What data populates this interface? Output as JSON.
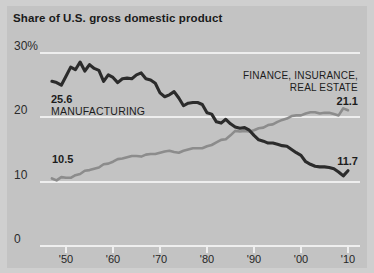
{
  "chart_data": {
    "type": "line",
    "title": "Share of U.S. gross domestic product",
    "xlabel": "",
    "ylabel": "",
    "ylim": [
      0,
      30
    ],
    "xlim": [
      1947,
      2011
    ],
    "grid": true,
    "legend_position": "inline-annotation",
    "yticks": [
      "30%",
      "20",
      "10",
      "0"
    ],
    "ytick_values": [
      30,
      20,
      10,
      0
    ],
    "xticks": [
      "'50",
      "'60",
      "'70",
      "'80",
      "'90",
      "'00",
      "'10"
    ],
    "xtick_values": [
      1950,
      1960,
      1970,
      1980,
      1990,
      2000,
      2010
    ],
    "series": [
      {
        "name": "MANUFACTURING",
        "color": "#2b2b2b",
        "start_label": "25.6",
        "end_label": "11.7",
        "start_value": 25.6,
        "end_value": 11.7,
        "x": [
          1947,
          1948,
          1949,
          1950,
          1951,
          1952,
          1953,
          1954,
          1955,
          1956,
          1957,
          1958,
          1959,
          1960,
          1961,
          1962,
          1963,
          1964,
          1965,
          1966,
          1967,
          1968,
          1969,
          1970,
          1971,
          1972,
          1973,
          1974,
          1975,
          1976,
          1977,
          1978,
          1979,
          1980,
          1981,
          1982,
          1983,
          1984,
          1985,
          1986,
          1987,
          1988,
          1989,
          1990,
          1991,
          1992,
          1993,
          1994,
          1995,
          1996,
          1997,
          1998,
          1999,
          2000,
          2001,
          2002,
          2003,
          2004,
          2005,
          2006,
          2007,
          2008,
          2009,
          2010
        ],
        "values": [
          25.6,
          25.4,
          25.0,
          26.4,
          27.8,
          27.4,
          28.6,
          27.2,
          28.2,
          27.6,
          27.3,
          25.6,
          26.6,
          26.2,
          25.4,
          26.0,
          26.1,
          26.0,
          26.6,
          26.9,
          26.0,
          25.8,
          25.3,
          23.8,
          23.2,
          23.5,
          24.0,
          23.0,
          21.8,
          22.2,
          22.3,
          22.3,
          22.0,
          20.7,
          20.5,
          19.3,
          19.1,
          19.7,
          19.0,
          18.5,
          18.3,
          18.4,
          18.0,
          17.2,
          16.5,
          16.3,
          16.0,
          16.0,
          15.8,
          15.6,
          15.5,
          15.0,
          14.5,
          14.1,
          13.1,
          12.7,
          12.4,
          12.3,
          12.3,
          12.2,
          12.0,
          11.5,
          10.9,
          11.7
        ]
      },
      {
        "name": "FINANCE, INSURANCE, REAL ESTATE",
        "color": "#8c8c8c",
        "start_label": "10.5",
        "end_label": "21.1",
        "start_value": 10.5,
        "end_value": 21.1,
        "x": [
          1947,
          1948,
          1949,
          1950,
          1951,
          1952,
          1953,
          1954,
          1955,
          1956,
          1957,
          1958,
          1959,
          1960,
          1961,
          1962,
          1963,
          1964,
          1965,
          1966,
          1967,
          1968,
          1969,
          1970,
          1971,
          1972,
          1973,
          1974,
          1975,
          1976,
          1977,
          1978,
          1979,
          1980,
          1981,
          1982,
          1983,
          1984,
          1985,
          1986,
          1987,
          1988,
          1989,
          1990,
          1991,
          1992,
          1993,
          1994,
          1995,
          1996,
          1997,
          1998,
          1999,
          2000,
          2001,
          2002,
          2003,
          2004,
          2005,
          2006,
          2007,
          2008,
          2009,
          2010
        ],
        "values": [
          10.5,
          10.2,
          10.7,
          10.6,
          10.6,
          11.0,
          11.2,
          11.7,
          11.8,
          12.0,
          12.2,
          12.7,
          12.8,
          13.1,
          13.5,
          13.6,
          13.8,
          14.0,
          14.0,
          13.9,
          14.2,
          14.3,
          14.3,
          14.5,
          14.7,
          14.8,
          14.6,
          14.5,
          14.8,
          15.0,
          15.2,
          15.2,
          15.2,
          15.5,
          15.7,
          16.1,
          16.5,
          16.6,
          17.2,
          17.9,
          17.8,
          17.9,
          17.8,
          18.0,
          18.3,
          18.4,
          18.8,
          18.9,
          19.3,
          19.6,
          19.8,
          20.2,
          20.3,
          20.3,
          20.6,
          20.8,
          20.8,
          20.6,
          20.7,
          20.7,
          20.5,
          20.3,
          21.4,
          21.1
        ]
      }
    ],
    "annotations": [
      {
        "text": "25.6",
        "bold": true
      },
      {
        "text": "MANUFACTURING",
        "bold": false
      },
      {
        "text": "10.5",
        "bold": true
      },
      {
        "text": "FINANCE, INSURANCE,",
        "bold": false
      },
      {
        "text": "REAL ESTATE",
        "bold": false
      },
      {
        "text": "21.1",
        "bold": true
      },
      {
        "text": "11.7",
        "bold": true
      }
    ]
  },
  "annotations": {
    "manufacturing_start_value": "25.6",
    "manufacturing_name": "MANUFACTURING",
    "manufacturing_end_value": "11.7",
    "finance_name_line1": "FINANCE, INSURANCE,",
    "finance_name_line2": "REAL ESTATE",
    "finance_end_value": "21.1",
    "finance_start_value": "10.5"
  },
  "colors": {
    "background": "#c3c3c3",
    "frame": "#cfcfcf",
    "gridline": "#eeeeee",
    "manufacturing_line": "#2b2b2b",
    "finance_line": "#8c8c8c",
    "text": "#1c1c1c"
  }
}
